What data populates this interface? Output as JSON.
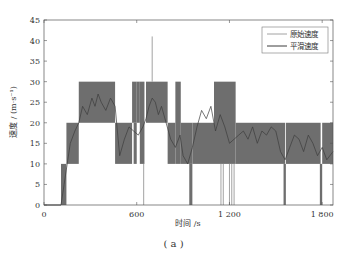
{
  "chart_data": {
    "type": "line",
    "title": "",
    "caption": "( a )",
    "xlabel": "时间 /s",
    "ylabel": "速度 / (m·s⁻¹)",
    "xlim": [
      0,
      1870
    ],
    "ylim": [
      0,
      45
    ],
    "xticks": [
      0,
      600,
      1200,
      1800
    ],
    "xtick_labels": [
      "0",
      "600",
      "1 200",
      "1 800"
    ],
    "yticks": [
      0,
      5,
      10,
      15,
      20,
      25,
      30,
      35,
      40,
      45
    ],
    "ytick_labels": [
      "0",
      "5",
      "10",
      "15",
      "20",
      "25",
      "30",
      "35",
      "40",
      "45"
    ],
    "grid": false,
    "legend_position": "upper right",
    "legend": [
      "原始速度",
      "平滑速度"
    ],
    "colors": {
      "raw": "#8a8a8a",
      "fill": "#6e6e6e",
      "smooth": "#3c3c3c",
      "axis": "#555555"
    },
    "series": [
      {
        "name": "原始速度",
        "description": "quantized raw speed switching rapidly between 10-m/s bands; rendered as dense shaded bands",
        "bands": [
          {
            "x0": 110,
            "x1": 145,
            "y0": 0,
            "y1": 10
          },
          {
            "x0": 145,
            "x1": 225,
            "y0": 10,
            "y1": 20
          },
          {
            "x0": 225,
            "x1": 460,
            "y0": 20,
            "y1": 30
          },
          {
            "x0": 460,
            "x1": 570,
            "y0": 10,
            "y1": 20
          },
          {
            "x0": 570,
            "x1": 600,
            "y0": 20,
            "y1": 30
          },
          {
            "x0": 580,
            "x1": 600,
            "y0": 10,
            "y1": 20
          },
          {
            "x0": 600,
            "x1": 620,
            "y0": 20,
            "y1": 30
          },
          {
            "x0": 620,
            "x1": 650,
            "y0": 10,
            "y1": 30
          },
          {
            "x0": 660,
            "x1": 800,
            "y0": 20,
            "y1": 30
          },
          {
            "x0": 800,
            "x1": 850,
            "y0": 10,
            "y1": 20
          },
          {
            "x0": 850,
            "x1": 885,
            "y0": 10,
            "y1": 30
          },
          {
            "x0": 885,
            "x1": 960,
            "y0": 10,
            "y1": 20
          },
          {
            "x0": 940,
            "x1": 960,
            "y0": 0,
            "y1": 10
          },
          {
            "x0": 960,
            "x1": 1100,
            "y0": 10,
            "y1": 20
          },
          {
            "x0": 1100,
            "x1": 1240,
            "y0": 10,
            "y1": 30
          },
          {
            "x0": 1240,
            "x1": 1560,
            "y0": 10,
            "y1": 20
          },
          {
            "x0": 1550,
            "x1": 1565,
            "y0": 0,
            "y1": 10
          },
          {
            "x0": 1565,
            "x1": 1790,
            "y0": 10,
            "y1": 20
          },
          {
            "x0": 1785,
            "x1": 1800,
            "y0": 0,
            "y1": 10
          },
          {
            "x0": 1800,
            "x1": 1870,
            "y0": 10,
            "y1": 20
          }
        ],
        "spikes": [
          {
            "x": 700,
            "y": 41
          },
          {
            "x": 645,
            "y": 0
          },
          {
            "x": 1145,
            "y": 0
          },
          {
            "x": 1160,
            "y": 0
          },
          {
            "x": 1200,
            "y": 0
          },
          {
            "x": 1215,
            "y": 0
          },
          {
            "x": 1230,
            "y": 0
          },
          {
            "x": 1440,
            "y": 30
          },
          {
            "x": 1480,
            "y": 30
          }
        ]
      },
      {
        "name": "平滑速度",
        "x": [
          0,
          110,
          130,
          150,
          170,
          200,
          225,
          250,
          280,
          310,
          330,
          350,
          370,
          400,
          430,
          460,
          490,
          520,
          550,
          580,
          610,
          640,
          660,
          680,
          700,
          720,
          740,
          760,
          790,
          820,
          850,
          880,
          900,
          930,
          960,
          990,
          1020,
          1050,
          1080,
          1110,
          1140,
          1170,
          1200,
          1230,
          1260,
          1290,
          1320,
          1350,
          1380,
          1410,
          1440,
          1470,
          1500,
          1530,
          1560,
          1590,
          1620,
          1650,
          1680,
          1710,
          1740,
          1770,
          1800,
          1830,
          1870
        ],
        "values": [
          0,
          0,
          5,
          10,
          15,
          18,
          20,
          24,
          22,
          26,
          24,
          27,
          25,
          23,
          26,
          24,
          12,
          16,
          19,
          18,
          17,
          19,
          21,
          24,
          26,
          25,
          22,
          24,
          20,
          16,
          14,
          17,
          12,
          10,
          14,
          19,
          23,
          21,
          24,
          18,
          22,
          19,
          15,
          16,
          17,
          18,
          16,
          19,
          15,
          18,
          17,
          19,
          18,
          13,
          11,
          14,
          17,
          16,
          13,
          17,
          15,
          12,
          14,
          11,
          13
        ]
      }
    ]
  }
}
